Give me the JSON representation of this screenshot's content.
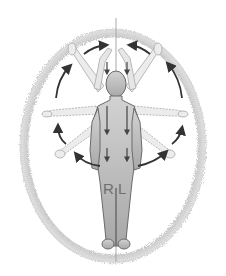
{
  "diagram": {
    "type": "anatomical-movement-illustration",
    "labels": {
      "right": "R",
      "left": "L"
    },
    "elements": {
      "aura_ellipse": {
        "color": "#bdbdbd",
        "style": "fuzzy hair-like outline"
      },
      "midline": {
        "color": "#9a9a9a"
      },
      "figure": {
        "fill": "#b9b9b9",
        "outline": "#6a6a6a"
      },
      "ghost_arms": {
        "positions": [
          "raised-overhead",
          "raised-diagonal",
          "horizontal",
          "lowered-diagonal"
        ],
        "color": "#c8c8c8"
      },
      "circular_arrows": {
        "count": 8,
        "color": "#333333",
        "direction": "around figure"
      },
      "down_arrows": {
        "count": 6,
        "color": "#444444"
      }
    },
    "colors": {
      "background": "#ffffff",
      "arrow": "#333333",
      "figure_fill": "#b9b9b9",
      "figure_outline": "#6a6a6a",
      "label_text": "#6f6f6f"
    }
  }
}
